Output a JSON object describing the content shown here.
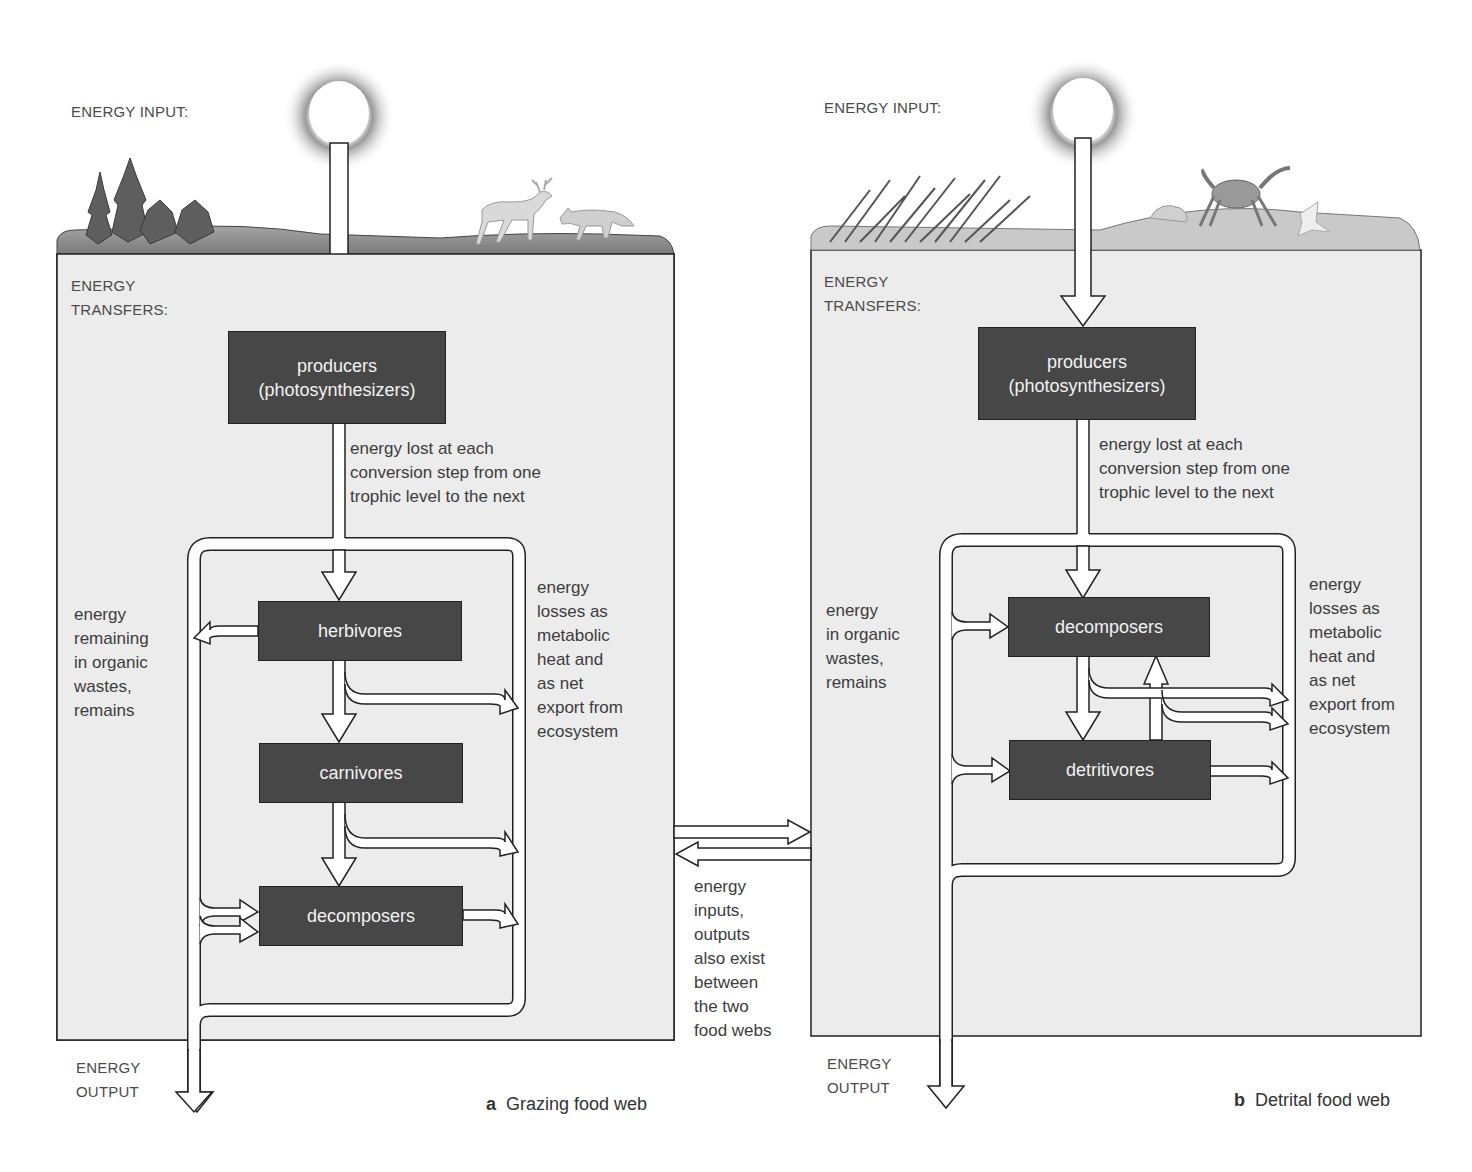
{
  "panels": [
    {
      "id": "a",
      "energy_input_label": "ENERGY INPUT:",
      "energy_transfers_label": "ENERGY\nTRANSFERS:",
      "energy_output_label": "ENERGY\nOUTPUT",
      "boxes": {
        "producers": "producers\n(photosynthesizers)",
        "herbivores": "herbivores",
        "carnivores": "carnivores",
        "decomposers": "decomposers"
      },
      "loss_note": "energy lost at each\nconversion step from one\ntrophic level to the next",
      "left_note": "energy\nremaining\nin organic\nwastes,\nremains",
      "right_note": "energy\nlosses as\nmetabolic\nheat and\nas net\nexport from\necosystem",
      "caption_letter": "a",
      "caption_text": "Grazing food web",
      "illustrations": [
        "conifer-trees",
        "deer",
        "fox"
      ]
    },
    {
      "id": "b",
      "energy_input_label": "ENERGY INPUT:",
      "energy_transfers_label": "ENERGY\nTRANSFERS:",
      "energy_output_label": "ENERGY\nOUTPUT",
      "boxes": {
        "producers": "producers\n(photosynthesizers)",
        "decomposers": "decomposers",
        "detritivores": "detritivores"
      },
      "loss_note": "energy lost at each\nconversion step from one\ntrophic level to the next",
      "left_note": "energy\nin organic\nwastes,\nremains",
      "right_note": "energy\nlosses as\nmetabolic\nheat and\nas net\nexport from\necosystem",
      "caption_letter": "b",
      "caption_text": "Detrital food web",
      "illustrations": [
        "marsh-grass",
        "crab",
        "shells",
        "starfish"
      ]
    }
  ],
  "between_note": "energy\ninputs,\noutputs\nalso exist\nbetween\nthe two\nfood webs",
  "colors": {
    "box_fill": "#474747",
    "panel_fill": "#ececec",
    "ground": "#8a8a8a",
    "arrow_fill": "#ffffff",
    "line": "#222222"
  }
}
